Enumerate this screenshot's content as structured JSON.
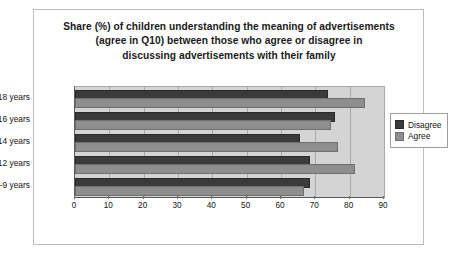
{
  "chart_data": {
    "type": "bar",
    "orientation": "horizontal",
    "title": "Share (%) of children understanding the meaning of advertisements (agree in Q10) between those who agree or disagree in discussing advertisements with their family",
    "title_lines": [
      "Share (%) of children understanding the meaning of advertisements",
      "(agree in Q10) between those who agree or disagree in",
      "discussing advertisements with their family"
    ],
    "categories": [
      "8-9 years",
      "10-12 years",
      "13-14 years",
      "15-16 years",
      "17-18 years"
    ],
    "series": [
      {
        "name": "Disagree",
        "color": "#3b3b3b",
        "values": [
          68,
          68,
          65,
          75,
          73
        ]
      },
      {
        "name": "Agree",
        "color": "#8e8e8e",
        "values": [
          66,
          81,
          76,
          74,
          84
        ]
      }
    ],
    "xlabel": "",
    "ylabel": "",
    "xlim": [
      0,
      90
    ],
    "xticks": [
      0,
      10,
      20,
      30,
      40,
      50,
      60,
      70,
      80,
      90
    ],
    "xtick_labels": [
      "0",
      "10",
      "20",
      "30",
      "40",
      "50",
      "60",
      "70",
      "80",
      "90"
    ],
    "grid": "vertical",
    "legend_position": "right",
    "plot_background": "#d4d4d4",
    "frame_border_color": "#bdbdbd"
  }
}
